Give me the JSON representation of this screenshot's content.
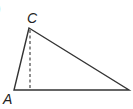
{
  "figure": {
    "part_marker": ")",
    "vertices": [
      {
        "label": "C",
        "x": 29,
        "y": 28
      },
      {
        "label": "A",
        "x": 14,
        "y": 90
      },
      {
        "label": "",
        "x": 129,
        "y": 90
      }
    ],
    "altitude": {
      "from": "C",
      "foot_x": 30,
      "foot_y": 90,
      "style": "dashed"
    },
    "colors": {
      "line": "#333333",
      "background": "#ffffff"
    }
  }
}
